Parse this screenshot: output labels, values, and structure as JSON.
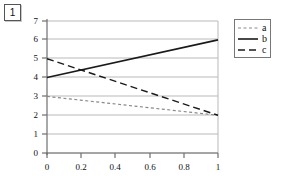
{
  "figure": {
    "badge_label": "1"
  },
  "chart_data": {
    "type": "line",
    "title": "",
    "xlabel": "",
    "ylabel": "",
    "xlim": [
      0,
      1
    ],
    "ylim": [
      0,
      7
    ],
    "grid": true,
    "grid_axis": "y",
    "legend_position": "outside-top-right",
    "x_ticks": [
      0,
      0.2,
      0.4,
      0.6,
      0.8,
      1
    ],
    "x_tick_labels": [
      "0",
      "0.2",
      "0.4",
      "0.6",
      "0.8",
      "1"
    ],
    "y_ticks": [
      0,
      1,
      2,
      3,
      4,
      5,
      6,
      7
    ],
    "y_tick_labels": [
      "0",
      "1",
      "2",
      "3",
      "4",
      "5",
      "6",
      "7"
    ],
    "x": [
      0,
      1
    ],
    "series": [
      {
        "name": "a",
        "values": [
          3,
          2
        ],
        "style": "dashed-fine",
        "color": "#8a8a8a"
      },
      {
        "name": "b",
        "values": [
          4,
          6
        ],
        "style": "solid",
        "color": "#1a1a1a"
      },
      {
        "name": "c",
        "values": [
          5,
          2
        ],
        "style": "dashed-long",
        "color": "#1a1a1a"
      }
    ]
  },
  "legend": {
    "entries": [
      {
        "label": "a"
      },
      {
        "label": "b"
      },
      {
        "label": "c"
      }
    ]
  },
  "colors": {
    "grid": "#b9b9b9",
    "axis": "#6e6e6e",
    "series_a": "#8a8a8a",
    "series_b": "#1a1a1a",
    "series_c": "#1a1a1a"
  }
}
